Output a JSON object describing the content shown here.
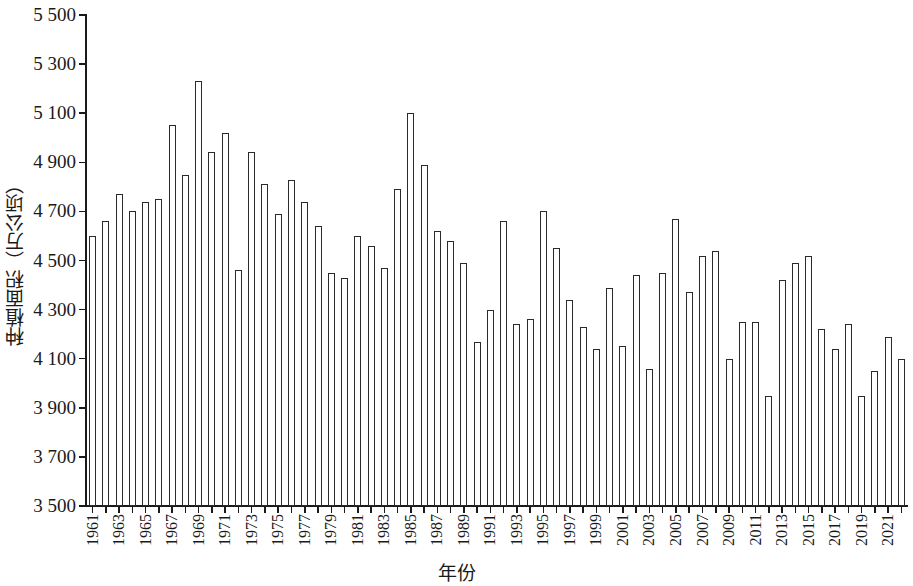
{
  "chart_data": {
    "type": "bar",
    "title": "",
    "subtitle": "",
    "xlabel": "年份",
    "ylabel": "种植面积（万公顷）",
    "ylim": [
      3500,
      5500
    ],
    "ytick_step": 200,
    "ytick_labels": [
      "5 500",
      "5 300",
      "5 100",
      "4 900",
      "4 700",
      "4 500",
      "4 300",
      "4 100",
      "3 900",
      "3 700",
      "3 500"
    ],
    "ytick_values": [
      5500,
      5300,
      5100,
      4900,
      4700,
      4500,
      4300,
      4100,
      3900,
      3700,
      3500
    ],
    "grid": false,
    "legend": null,
    "bar_style": {
      "fill": "#ffffff",
      "edge": "#2a2a2a"
    },
    "xtick_label_interval": 2,
    "categories": [
      "1961",
      "1962",
      "1963",
      "1964",
      "1965",
      "1966",
      "1967",
      "1968",
      "1969",
      "1970",
      "1971",
      "1972",
      "1973",
      "1974",
      "1975",
      "1976",
      "1977",
      "1978",
      "1979",
      "1980",
      "1981",
      "1982",
      "1983",
      "1984",
      "1985",
      "1986",
      "1987",
      "1988",
      "1989",
      "1990",
      "1991",
      "1992",
      "1993",
      "1994",
      "1995",
      "1996",
      "1997",
      "1998",
      "1999",
      "2000",
      "2001",
      "2002",
      "2003",
      "2004",
      "2005",
      "2006",
      "2007",
      "2008",
      "2009",
      "2010",
      "2011",
      "2012",
      "2013",
      "2014",
      "2015",
      "2016",
      "2017",
      "2018",
      "2019",
      "2020",
      "2021",
      "2022"
    ],
    "values": [
      4600,
      4660,
      4770,
      4700,
      4740,
      4750,
      5050,
      4850,
      5230,
      4940,
      5020,
      4460,
      4940,
      4810,
      4690,
      4830,
      4740,
      4640,
      4450,
      4430,
      4600,
      4560,
      4470,
      4790,
      5100,
      4890,
      4620,
      4580,
      4490,
      4170,
      4300,
      4660,
      4240,
      4260,
      4700,
      4550,
      4340,
      4230,
      4140,
      4390,
      4150,
      4440,
      4060,
      4450,
      4670,
      4370,
      4520,
      4540,
      4100,
      4250,
      4250,
      3950,
      4420,
      4490,
      4520,
      4220,
      4140,
      4240,
      3950,
      4050,
      4190,
      4100
    ]
  }
}
